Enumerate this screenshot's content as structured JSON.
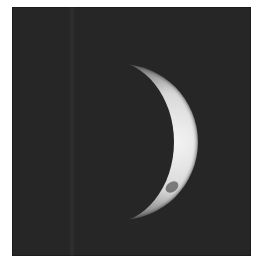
{
  "image": {
    "subject": "crescent planet",
    "colors": {
      "background": "#262626",
      "crescent_bright": "#f2f2f2",
      "crescent_mid": "#9a9a9a",
      "frame": "#ffffff"
    }
  }
}
